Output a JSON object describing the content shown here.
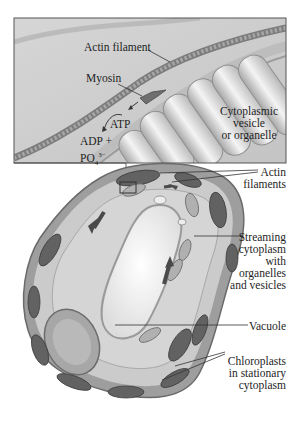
{
  "figure": {
    "inset": {
      "labels": {
        "actin_filament": "Actin filament",
        "myosin": "Myosin",
        "atp": "ATP",
        "adp": "ADP +",
        "phosphate_base": "PO",
        "phosphate_sub": "4",
        "phosphate_sup": "3−",
        "cytoplasmic_vesicle_line1": "Cytoplasmic",
        "cytoplasmic_vesicle_line2": "vesicle",
        "cytoplasmic_vesicle_line3": "or organelle"
      }
    },
    "cell": {
      "labels": {
        "actin_filaments_line1": "Actin",
        "actin_filaments_line2": "filaments",
        "streaming_line1": "Streaming",
        "streaming_line2": "cytoplasm",
        "streaming_line3": "with",
        "streaming_line4": "organelles",
        "streaming_line5": "and vesicles",
        "vacuole": "Vacuole",
        "chloroplasts_line1": "Chloroplasts",
        "chloroplasts_line2": "in stationary",
        "chloroplasts_line3": "cytoplasm"
      }
    },
    "colors": {
      "inset_bg": "#d9d9d9",
      "cell_wall": "#9a9a9a",
      "cytoplasm": "#c9c9c9",
      "vacuole": "#f2f2f2",
      "chloroplast": "#5e5e5e",
      "leader_line": "#333333"
    }
  }
}
